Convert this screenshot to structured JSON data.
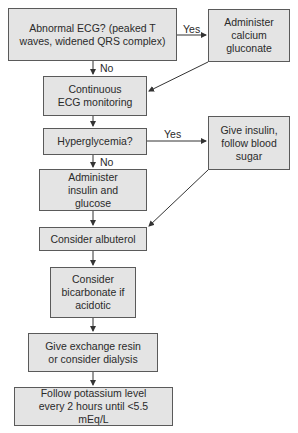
{
  "flowchart": {
    "nodes": {
      "abnormal_ecg": "Abnormal ECG? (peaked T waves, widened QRS complex)",
      "calcium": "Administer calcium gluconate",
      "continuous_ecg": "Continuous ECG monitoring",
      "hyperglycemia": "Hyperglycemia?",
      "give_insulin": "Give insulin, follow blood sugar",
      "insulin_glucose": "Administer insulin and glucose",
      "albuterol": "Consider albuterol",
      "bicarbonate": "Consider bicarbonate if acidotic",
      "exchange_resin": "Give exchange resin or consider dialysis",
      "follow_potassium": "Follow potassium level every 2 hours until <5.5 mEq/L"
    },
    "edge_labels": {
      "ecg_yes": "Yes",
      "ecg_no": "No",
      "hyper_yes": "Yes",
      "hyper_no": "No"
    }
  },
  "colors": {
    "box_fill": "#e4e4e4",
    "box_border": "#5a5a5a",
    "edge": "#333333"
  }
}
